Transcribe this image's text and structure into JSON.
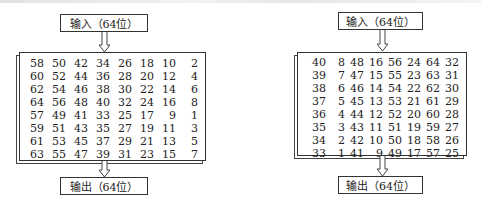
{
  "left_diagram": {
    "input_label": "输入（64位）",
    "output_label": "输出（64位）",
    "table": [
      [
        58,
        50,
        42,
        34,
        26,
        18,
        10,
        2
      ],
      [
        60,
        52,
        44,
        36,
        28,
        20,
        12,
        4
      ],
      [
        62,
        54,
        46,
        38,
        30,
        22,
        14,
        6
      ],
      [
        64,
        56,
        48,
        40,
        32,
        24,
        16,
        8
      ],
      [
        57,
        49,
        41,
        33,
        25,
        17,
        9,
        1
      ],
      [
        59,
        51,
        43,
        35,
        27,
        19,
        11,
        3
      ],
      [
        61,
        53,
        45,
        37,
        29,
        21,
        13,
        5
      ],
      [
        63,
        55,
        47,
        39,
        31,
        23,
        15,
        7
      ]
    ]
  },
  "right_diagram": {
    "input_label": "输入（64位）",
    "output_label": "输出（64位）",
    "table": [
      [
        40,
        8,
        48,
        16,
        56,
        24,
        64,
        32
      ],
      [
        39,
        7,
        47,
        15,
        55,
        23,
        63,
        31
      ],
      [
        38,
        6,
        46,
        14,
        54,
        22,
        62,
        30
      ],
      [
        37,
        5,
        45,
        13,
        53,
        21,
        61,
        29
      ],
      [
        36,
        4,
        44,
        12,
        52,
        20,
        60,
        28
      ],
      [
        35,
        3,
        43,
        11,
        51,
        19,
        59,
        27
      ],
      [
        34,
        2,
        42,
        10,
        50,
        18,
        58,
        26
      ],
      [
        33,
        1,
        41,
        9,
        49,
        17,
        57,
        25
      ]
    ]
  }
}
